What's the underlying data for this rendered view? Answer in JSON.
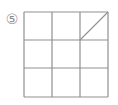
{
  "figure": {
    "width": 118,
    "height": 105,
    "background_color": "#ffffff",
    "label": {
      "name": "circled-number-label",
      "text": "⑤",
      "plain_value": "5",
      "color": "#8d8d8d",
      "x": 12,
      "y": 19
    },
    "grid": {
      "name": "three-by-three-grid",
      "rows": 3,
      "cols": 3,
      "line_color": "#909090",
      "line_width": 1.2,
      "x_positions": [
        24,
        52,
        80,
        108
      ],
      "y_positions": [
        12,
        40,
        68,
        97
      ]
    },
    "diagonal": {
      "name": "diagonal-line-top-right-cell",
      "cell_row": 1,
      "cell_col": 3,
      "from_x": 80,
      "from_y": 40,
      "to_x": 108,
      "to_y": 12,
      "color": "#909090",
      "line_width": 1.1
    }
  }
}
